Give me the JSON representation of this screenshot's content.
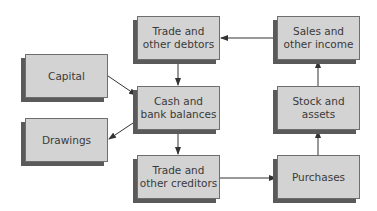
{
  "diagram": {
    "nodes": {
      "capital": {
        "label": "Capital"
      },
      "drawings": {
        "label": "Drawings"
      },
      "trade_debtors": {
        "label": "Trade and\nother debtors"
      },
      "cash": {
        "label": "Cash and\nbank balances"
      },
      "trade_creditors": {
        "label": "Trade and\nother creditors"
      },
      "sales": {
        "label": "Sales and\nother income"
      },
      "stock": {
        "label": "Stock and\nassets"
      },
      "purchases": {
        "label": "Purchases"
      }
    },
    "edges": [
      {
        "from": "capital",
        "to": "cash"
      },
      {
        "from": "cash",
        "to": "drawings"
      },
      {
        "from": "trade_debtors",
        "to": "cash"
      },
      {
        "from": "cash",
        "to": "trade_creditors"
      },
      {
        "from": "trade_creditors",
        "to": "purchases"
      },
      {
        "from": "purchases",
        "to": "stock"
      },
      {
        "from": "stock",
        "to": "sales"
      },
      {
        "from": "sales",
        "to": "trade_debtors"
      }
    ],
    "colors": {
      "box_fill": "#d3d3d3",
      "box_border": "#6e6e6e",
      "shadow": "#5a5a5a",
      "arrow": "#333333"
    }
  }
}
